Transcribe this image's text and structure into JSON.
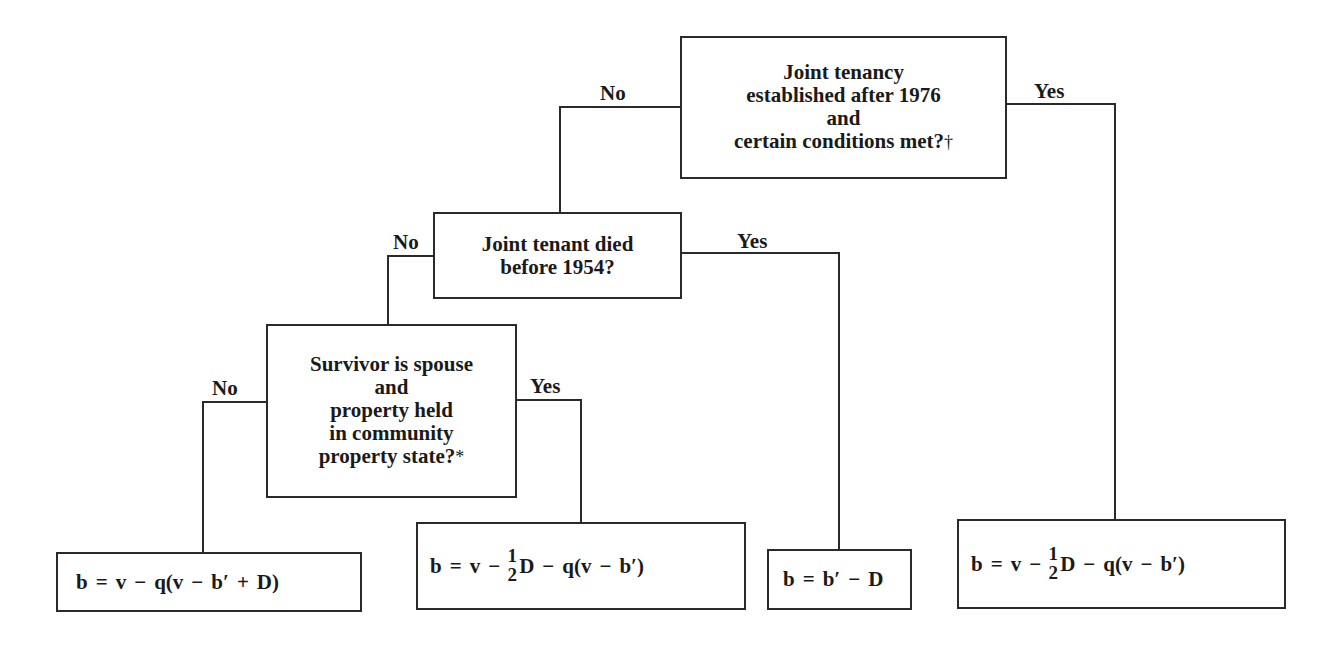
{
  "diagram": {
    "type": "decision-tree",
    "nodes": {
      "q1": {
        "lines": [
          "Joint tenancy",
          "established after 1976",
          "and",
          "certain conditions met?"
        ],
        "mark": "†"
      },
      "q2": {
        "lines": [
          "Joint tenant died",
          "before 1954?"
        ]
      },
      "q3": {
        "lines": [
          "Survivor is spouse",
          "and",
          "property held",
          "in community",
          "property state?"
        ],
        "mark": "*"
      }
    },
    "branch_labels": {
      "q1_no": "No",
      "q1_yes": "Yes",
      "q2_no": "No",
      "q2_yes": "Yes",
      "q3_no": "No",
      "q3_yes": "Yes"
    },
    "outcomes": {
      "f1": {
        "text": "b = v − q(v − b′ + D)",
        "parts": [
          "b",
          "=",
          "v",
          "−",
          "q(v",
          "−",
          "b′",
          "+",
          "D)"
        ]
      },
      "f2": {
        "text": "b = v − ½D − q(v − b′)",
        "pre": [
          "b",
          "=",
          "v",
          "−"
        ],
        "frac_num": "1",
        "frac_den": "2",
        "post": [
          "D",
          "−",
          "q(v",
          "−",
          "b′)"
        ]
      },
      "f3": {
        "text": "b = b′ − D",
        "parts": [
          "b",
          "=",
          "b′",
          "−",
          "D"
        ]
      },
      "f4": {
        "text": "b = v − ½D − q(v − b′)",
        "pre": [
          "b",
          "=",
          "v",
          "−"
        ],
        "frac_num": "1",
        "frac_den": "2",
        "post": [
          "D",
          "−",
          "q(v",
          "−",
          "b′)"
        ]
      }
    },
    "edges": [
      {
        "from": "q1",
        "to": "q2",
        "label": "No"
      },
      {
        "from": "q1",
        "to": "f4",
        "label": "Yes"
      },
      {
        "from": "q2",
        "to": "q3",
        "label": "No"
      },
      {
        "from": "q2",
        "to": "f3",
        "label": "Yes"
      },
      {
        "from": "q3",
        "to": "f1",
        "label": "No"
      },
      {
        "from": "q3",
        "to": "f2",
        "label": "Yes"
      }
    ],
    "colors": {
      "line": "#2a2a2a",
      "text": "#1a1a1a",
      "background": "#ffffff"
    }
  }
}
